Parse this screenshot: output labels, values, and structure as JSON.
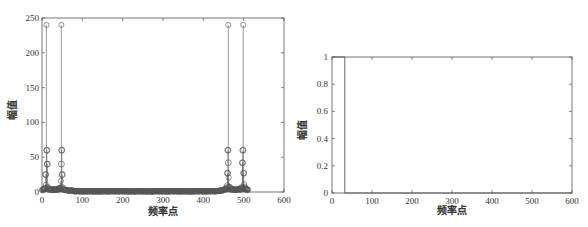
{
  "chart_data": [
    {
      "type": "stem",
      "title": "",
      "xlabel": "频率点",
      "ylabel": "幅值",
      "xlim": [
        0,
        600
      ],
      "ylim": [
        0,
        250
      ],
      "xticks": [
        0,
        100,
        200,
        300,
        400,
        500,
        600
      ],
      "yticks": [
        0,
        50,
        100,
        150,
        200,
        250
      ],
      "grid": false,
      "marker": "circle",
      "description": "Magnitude spectrum of 512-point FFT; strong symmetric peaks near bins 11, 48, 462, 499; noise floor near 0 between ~70 and ~440.",
      "peaks": [
        {
          "x": 11,
          "y": 240
        },
        {
          "x": 48,
          "y": 240
        },
        {
          "x": 462,
          "y": 240
        },
        {
          "x": 499,
          "y": 240
        }
      ],
      "secondary_points": [
        {
          "x": 12,
          "y": 60
        },
        {
          "x": 13,
          "y": 40
        },
        {
          "x": 9,
          "y": 25
        },
        {
          "x": 49,
          "y": 60
        },
        {
          "x": 48,
          "y": 40
        },
        {
          "x": 50,
          "y": 25
        },
        {
          "x": 461,
          "y": 60
        },
        {
          "x": 462,
          "y": 42
        },
        {
          "x": 460,
          "y": 27
        },
        {
          "x": 498,
          "y": 60
        },
        {
          "x": 497,
          "y": 42
        },
        {
          "x": 500,
          "y": 27
        }
      ],
      "n_points": 512
    },
    {
      "type": "line",
      "title": "",
      "xlabel": "频率点",
      "ylabel": "幅值",
      "xlim": [
        0,
        600
      ],
      "ylim": [
        0,
        1
      ],
      "xticks": [
        0,
        100,
        200,
        300,
        400,
        500,
        600
      ],
      "yticks": [
        "0",
        "0.2",
        "0.4",
        "0.6",
        "0.8",
        "1"
      ],
      "grid": false,
      "description": "Ideal low-pass filter response: value 1 from 0 to ~32, then 0 to 600.",
      "x": [
        0,
        32,
        32,
        600
      ],
      "y": [
        1,
        1,
        0,
        0
      ]
    }
  ],
  "left": {
    "xlabel": "频率点",
    "ylabel": "幅值",
    "xticks": [
      "0",
      "100",
      "200",
      "300",
      "400",
      "500",
      "600"
    ],
    "yticks": [
      "0",
      "50",
      "100",
      "150",
      "200",
      "250"
    ]
  },
  "right": {
    "xlabel": "频率点",
    "ylabel": "幅值",
    "xticks": [
      "0",
      "100",
      "200",
      "300",
      "400",
      "500",
      "600"
    ],
    "yticks": [
      "0",
      "0.2",
      "0.4",
      "0.6",
      "0.8",
      "1"
    ]
  }
}
